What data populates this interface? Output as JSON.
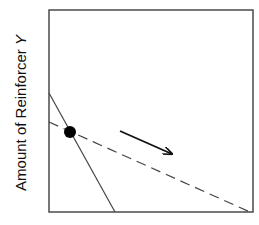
{
  "chart_data": {
    "type": "line",
    "title": "",
    "xlabel": "",
    "ylabel": "Amount of Reinforcer Y",
    "ylabel_parts": {
      "text": "Amount of Reinforcer ",
      "variable": "Y"
    },
    "grid": false,
    "legend": null,
    "axes_box": {
      "left": 49,
      "top": 10,
      "right": 253,
      "bottom": 212
    },
    "series": [
      {
        "name": "original-budget-line",
        "style": "solid",
        "color": "#333333",
        "points": [
          [
            49,
            93
          ],
          [
            115,
            212
          ]
        ]
      },
      {
        "name": "new-budget-line",
        "style": "dashed",
        "color": "#333333",
        "points": [
          [
            49,
            122
          ],
          [
            250,
            212
          ]
        ]
      }
    ],
    "markers": [
      {
        "name": "intersection-point",
        "x": 70,
        "y": 132,
        "r": 6,
        "color": "#000000"
      }
    ],
    "annotations": [
      {
        "type": "arrow",
        "from": [
          120,
          131
        ],
        "to": [
          172,
          154
        ],
        "color": "#111111"
      }
    ]
  }
}
